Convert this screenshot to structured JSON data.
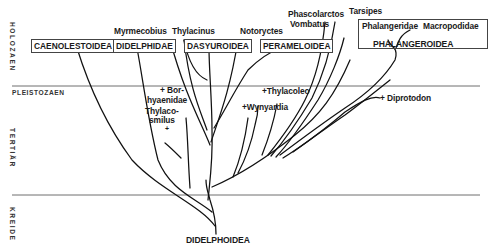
{
  "eras": {
    "holozaen": "HOLOZAEN",
    "pleistozaen": "PLEISTOZAEN",
    "tertiaer": "TERTIÄR",
    "kreide": "KREIDE"
  },
  "root": "DIDELPHOIDEA",
  "groups": {
    "caenolestoidea": "CAENOLESTOIDEA",
    "didelphidae": "DIDELPHIDAE",
    "dasyuroidea": "DASYUROIDEA",
    "perameloidea": "PERAMELOIDEA",
    "phalangeroidea": "PHALANGEROIDEA"
  },
  "taxa": {
    "myrmecobius": "Myrmecobius",
    "thylacinus": "Thylacinus",
    "notoryctes": "Notoryctes",
    "phascolarctos": "Phascolarctos",
    "vombatus": "Vombatus",
    "tarsipes": "Tarsipes",
    "phalangeridae": "Phalangeridae",
    "macropodidae": "Macropodidae"
  },
  "extinct": {
    "borhyaenidae_1": "+ Bor-",
    "borhyaenidae_2": "hyaenidae",
    "thylacosmilus_1": "Thylaco-",
    "thylacosmilus_2": "smilus",
    "thylacosmilus_mark": "+",
    "thylacoleo": "+Thylacoleo",
    "wynyardia": "+Wynyardia",
    "diprotodon": "+ Diprotodon"
  }
}
